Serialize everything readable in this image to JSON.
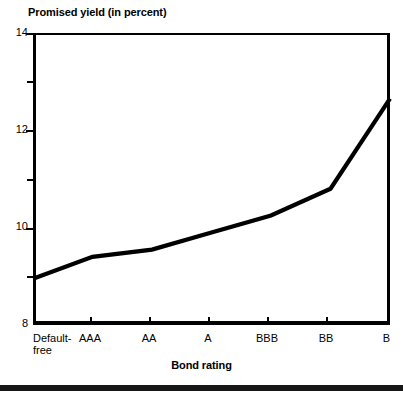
{
  "chart_data": {
    "type": "line",
    "title": "Promised yield (in percent)",
    "xlabel": "Bond rating",
    "ylabel": "Promised yield (in percent)",
    "categories": [
      "Default-\nfree",
      "AAA",
      "AA",
      "A",
      "BBB",
      "BB",
      "B"
    ],
    "values": [
      8.95,
      9.4,
      9.55,
      9.9,
      10.25,
      10.8,
      12.65
    ],
    "ylim": [
      8,
      14
    ],
    "xlim": [
      0,
      6
    ],
    "y_ticks_major": [
      8,
      10,
      12,
      14
    ],
    "y_ticks_major_labels": [
      "8",
      "10",
      "12",
      "14"
    ],
    "y_ticks_minor": [
      9,
      11,
      13
    ],
    "grid": false,
    "legend": false,
    "legend_position": "none",
    "line_color": "#000000",
    "frame_color": "#000000",
    "background_color": "#ffffff"
  },
  "figure": {
    "y_axis_title": "Promised yield (in percent)",
    "x_axis_title": "Bond rating"
  }
}
